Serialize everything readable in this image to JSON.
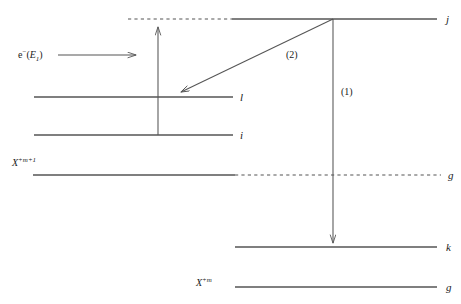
{
  "figure": {
    "type": "energy-level-diagram",
    "width": 461,
    "height": 304,
    "background": "#ffffff",
    "line_color": "#555555",
    "text_color": "#1a1a1a"
  },
  "levels": [
    {
      "id": "j",
      "label": "j",
      "label_x": 446,
      "label_y": 14,
      "y": 19,
      "solid": {
        "x1": 232,
        "x2": 437
      },
      "dashed": {
        "x1": 128,
        "x2": 232
      }
    },
    {
      "id": "l",
      "label": "l",
      "label_x": 240,
      "label_y": 92,
      "y": 97,
      "solid": {
        "x1": 34,
        "x2": 233
      },
      "dashed": null
    },
    {
      "id": "i",
      "label": "i",
      "label_x": 240,
      "label_y": 130,
      "y": 135,
      "solid": {
        "x1": 34,
        "x2": 233
      },
      "dashed": null
    },
    {
      "id": "g-upper",
      "label": "g",
      "label_x": 448,
      "label_y": 170,
      "y": 175,
      "solid": {
        "x1": 33,
        "x2": 235
      },
      "dashed": {
        "x1": 235,
        "x2": 441
      }
    },
    {
      "id": "k",
      "label": "k",
      "label_x": 446,
      "label_y": 242,
      "y": 247,
      "solid": {
        "x1": 235,
        "x2": 437
      },
      "dashed": null
    },
    {
      "id": "g-lower",
      "label": "g",
      "label_x": 446,
      "label_y": 282,
      "y": 287,
      "solid": {
        "x1": 235,
        "x2": 437
      },
      "dashed": null
    }
  ],
  "ion_labels": [
    {
      "id": "ion-upper",
      "base": "X",
      "superscript": "+m+1",
      "x": 12,
      "y": 158
    },
    {
      "id": "ion-lower",
      "base": "X",
      "superscript": "+m",
      "x": 196,
      "y": 278
    }
  ],
  "beam": {
    "label_base": "e",
    "label_superscript": "−",
    "label_paren_open": "(",
    "label_energy": "E",
    "label_energy_sub": "1",
    "label_paren_close": ")",
    "label_x": 18,
    "label_y": 50,
    "arrow": {
      "x1": 58,
      "y1": 55,
      "x2": 140,
      "y2": 55
    }
  },
  "transitions": [
    {
      "id": "excitation-arrow",
      "direction": "up",
      "x1": 158,
      "y1": 135,
      "x2": 158,
      "y2": 24,
      "label": null
    },
    {
      "id": "transition-2",
      "direction": "down-left",
      "x1": 333,
      "y1": 19,
      "x2": 178,
      "y2": 93,
      "label": "(2)",
      "label_x": 286,
      "label_y": 50
    },
    {
      "id": "transition-1",
      "direction": "down",
      "x1": 333,
      "y1": 19,
      "x2": 333,
      "y2": 246,
      "label": "(1)",
      "label_x": 341,
      "label_y": 87
    }
  ]
}
